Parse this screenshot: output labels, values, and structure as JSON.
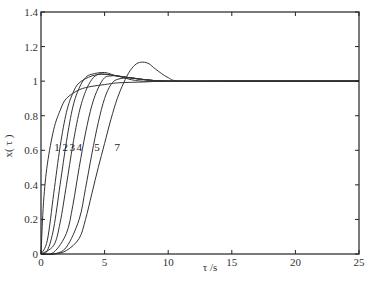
{
  "chart_data": {
    "type": "line",
    "title": "",
    "xlabel": "τ /s",
    "ylabel": "x( τ )",
    "xlim": [
      0,
      25
    ],
    "ylim": [
      0,
      1.4
    ],
    "xticks": [
      0,
      5,
      10,
      15,
      20,
      25
    ],
    "yticks": [
      0,
      0.2,
      0.4,
      0.6,
      0.8,
      1,
      1.2,
      1.4
    ],
    "xtick_labels": [
      "0",
      "5",
      "10",
      "15",
      "20",
      "25"
    ],
    "ytick_labels": [
      "0",
      "0.2",
      "0.4",
      "0.6",
      "0.8",
      "1",
      "1.2",
      "1.4"
    ],
    "grid": false,
    "legend": "inline curve labels near x≈0.6",
    "series": [
      {
        "name": "1",
        "x": [
          0,
          0.2,
          0.5,
          1,
          1.5,
          2,
          3,
          4,
          5,
          6,
          8,
          10,
          15,
          25
        ],
        "y": [
          0,
          0.3,
          0.52,
          0.72,
          0.83,
          0.9,
          0.95,
          0.97,
          0.98,
          0.99,
          0.995,
          1.0,
          1.0,
          1.0
        ]
      },
      {
        "name": "2",
        "x": [
          0,
          0.5,
          1,
          1.5,
          2,
          2.5,
          3,
          4,
          5,
          6,
          8,
          10,
          15,
          25
        ],
        "y": [
          0,
          0.08,
          0.35,
          0.62,
          0.82,
          0.93,
          0.99,
          1.03,
          1.04,
          1.03,
          1.01,
          1.0,
          1.0,
          1.0
        ]
      },
      {
        "name": "3",
        "x": [
          0,
          0.5,
          1,
          1.5,
          2,
          2.5,
          3,
          3.5,
          4,
          5,
          6,
          8,
          10,
          15,
          25
        ],
        "y": [
          0,
          0.02,
          0.15,
          0.4,
          0.65,
          0.85,
          0.96,
          1.02,
          1.04,
          1.05,
          1.03,
          1.01,
          1.0,
          1.0,
          1.0
        ]
      },
      {
        "name": "4",
        "x": [
          0,
          1,
          1.5,
          2,
          2.5,
          3,
          3.5,
          4,
          4.5,
          5,
          6,
          7,
          8,
          10,
          15,
          25
        ],
        "y": [
          0,
          0.05,
          0.18,
          0.4,
          0.63,
          0.82,
          0.94,
          1.01,
          1.04,
          1.04,
          1.03,
          1.01,
          1.0,
          1.0,
          1.0,
          1.0
        ]
      },
      {
        "name": "5",
        "x": [
          0,
          1,
          2,
          2.5,
          3,
          3.5,
          4,
          4.5,
          5,
          5.5,
          6,
          7,
          8,
          10,
          15,
          25
        ],
        "y": [
          0,
          0.01,
          0.12,
          0.28,
          0.5,
          0.7,
          0.86,
          0.96,
          1.02,
          1.03,
          1.03,
          1.02,
          1.01,
          1.0,
          1.0,
          1.0
        ]
      },
      {
        "name": "6",
        "x": [
          0,
          1,
          2,
          3,
          3.5,
          4,
          4.5,
          5,
          5.5,
          6,
          7,
          8,
          10,
          15,
          25
        ],
        "y": [
          0,
          0.0,
          0.04,
          0.2,
          0.38,
          0.58,
          0.76,
          0.9,
          0.98,
          1.01,
          1.02,
          1.01,
          1.0,
          1.0,
          1.0
        ]
      },
      {
        "name": "7",
        "x": [
          0,
          1,
          2,
          3,
          3.5,
          4,
          4.5,
          5,
          5.5,
          6,
          6.5,
          7,
          7.5,
          8,
          8.5,
          9,
          10,
          11,
          15,
          25
        ],
        "y": [
          0,
          0.0,
          0.02,
          0.09,
          0.2,
          0.35,
          0.5,
          0.64,
          0.78,
          0.9,
          0.99,
          1.06,
          1.1,
          1.11,
          1.1,
          1.07,
          1.02,
          1.0,
          1.0,
          1.0
        ]
      }
    ],
    "curve_label_positions": [
      {
        "label": "1",
        "x": 1.25,
        "y": 0.62
      },
      {
        "label": "2",
        "x": 1.9,
        "y": 0.62
      },
      {
        "label": "3",
        "x": 2.45,
        "y": 0.62
      },
      {
        "label": "4",
        "x": 3.0,
        "y": 0.62
      },
      {
        "label": "5",
        "x": 4.4,
        "y": 0.62
      },
      {
        "label": "7",
        "x": 6.0,
        "y": 0.62
      }
    ]
  }
}
